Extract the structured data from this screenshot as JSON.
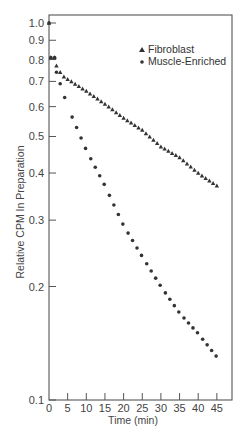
{
  "chart_data": {
    "type": "scatter",
    "title": "",
    "xlabel": "Time (min)",
    "ylabel": "Relative CPM In Preparation",
    "yscale": "log",
    "xlim": [
      0,
      49
    ],
    "ylim": [
      0.1,
      1.05
    ],
    "xticks": [
      0,
      5,
      10,
      15,
      20,
      25,
      30,
      35,
      40,
      45
    ],
    "yticks": [
      1.0,
      0.9,
      0.8,
      0.7,
      0.6,
      0.5,
      0.4,
      0.3,
      0.2,
      0.1
    ],
    "ytick_labels": [
      "1.0",
      "0.9",
      "0.8",
      "0.7",
      "0.6",
      "0.5",
      "0.4",
      "0.3",
      "0.2",
      "0.1"
    ],
    "grid": false,
    "legend_position": "upper right",
    "series": [
      {
        "name": "Fibroblast",
        "marker": "triangle",
        "start": {
          "x": 0,
          "y": 1.0
        },
        "points": [
          [
            0,
            1.0
          ],
          [
            0.5,
            0.81
          ],
          [
            1.5,
            0.81
          ],
          [
            2,
            0.77
          ],
          [
            3,
            0.74
          ],
          [
            4,
            0.72
          ],
          [
            5,
            0.71
          ],
          [
            10,
            0.66
          ],
          [
            15,
            0.61
          ],
          [
            20,
            0.56
          ],
          [
            25,
            0.52
          ],
          [
            30,
            0.47
          ],
          [
            35,
            0.44
          ],
          [
            40,
            0.4
          ],
          [
            45,
            0.37
          ]
        ]
      },
      {
        "name": "Muscle-Enriched",
        "marker": "circle",
        "points": [
          [
            0,
            1.0
          ],
          [
            0.5,
            0.81
          ],
          [
            1.5,
            0.81
          ],
          [
            2,
            0.74
          ],
          [
            3,
            0.69
          ],
          [
            5,
            0.6
          ],
          [
            10,
            0.46
          ],
          [
            15,
            0.37
          ],
          [
            20,
            0.29
          ],
          [
            25,
            0.24
          ],
          [
            30,
            0.2
          ],
          [
            35,
            0.17
          ],
          [
            40,
            0.15
          ],
          [
            45,
            0.13
          ]
        ]
      }
    ]
  },
  "axes": {
    "x_tick_labels": [
      "0",
      "5",
      "10",
      "15",
      "20",
      "25",
      "30",
      "35",
      "40",
      "45"
    ],
    "y_tick_labels": [
      "1.0",
      "0.9",
      "0.8",
      "0.7",
      "0.6",
      "0.5",
      "0.4",
      "0.3",
      "0.2",
      "0.1"
    ],
    "xlabel": "Time (min)",
    "ylabel": "Relative CPM In Preparation"
  },
  "legend": {
    "items": [
      {
        "label": "Fibroblast",
        "marker": "triangle"
      },
      {
        "label": "Muscle-Enriched",
        "marker": "circle"
      }
    ]
  },
  "colors": {
    "ink": "#333333",
    "axis": "#555555"
  }
}
